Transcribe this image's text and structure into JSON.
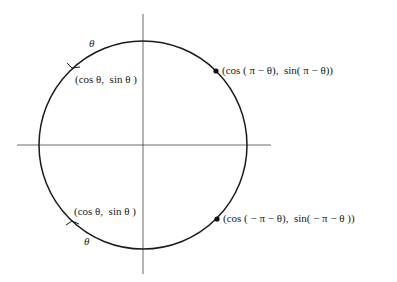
{
  "diagram": {
    "type": "unit-circle",
    "colors": {
      "stroke": "#1a1a1a",
      "axis": "#333333",
      "background": "#ffffff"
    },
    "axes": {
      "horizontal": {
        "x1": 17,
        "x2": 271,
        "y": 145
      },
      "vertical": {
        "x": 143,
        "y1": 14,
        "y2": 274
      }
    },
    "circle": {
      "cx": 143,
      "cy": 145,
      "r": 104
    },
    "points": [
      {
        "x": 216,
        "y": 71
      },
      {
        "x": 217,
        "y": 219
      }
    ],
    "labels": {
      "theta_top": "θ",
      "theta_bottom": "θ",
      "upper_left": "(cos θ,  sin θ )",
      "lower_left": "(cos θ,  sin θ )",
      "upper_right": "(cos ( π − θ),  sin( π − θ))",
      "lower_right": "(cos ( − π − θ),  sin( − π − θ ))"
    }
  }
}
